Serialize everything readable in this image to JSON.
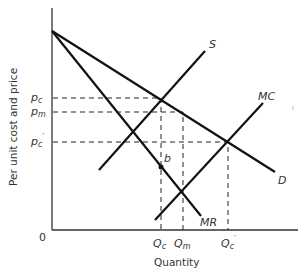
{
  "diagram": {
    "y_axis_label": "Per unit cost and price",
    "x_axis_label": "Quantity",
    "origin_label": "0",
    "curves": {
      "demand": "D",
      "marginal_revenue": "MR",
      "supply": "S",
      "marginal_cost": "MC"
    },
    "price_labels": [
      {
        "id": "pc",
        "main": "p",
        "sub": "c",
        "prime": ""
      },
      {
        "id": "pm",
        "main": "p",
        "sub": "m",
        "prime": ""
      },
      {
        "id": "pc_prime",
        "main": "p",
        "sub": "c",
        "prime": "′"
      }
    ],
    "quantity_labels": [
      {
        "id": "Qc",
        "main": "Q",
        "sub": "c",
        "prime": ""
      },
      {
        "id": "Qm",
        "main": "Q",
        "sub": "m",
        "prime": ""
      },
      {
        "id": "Qc_prime",
        "main": "Q",
        "sub": "c",
        "prime": "′"
      }
    ],
    "point_label": "b"
  }
}
